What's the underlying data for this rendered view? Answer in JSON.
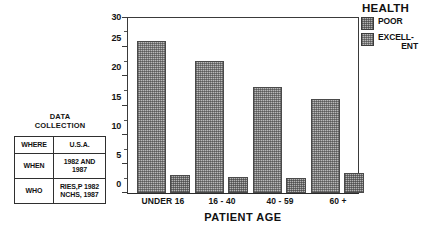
{
  "chart_data": {
    "type": "bar",
    "title": "",
    "xlabel": "PATIENT AGE",
    "ylabel": "",
    "categories": [
      "UNDER 16",
      "16 - 40",
      "40 - 59",
      "60 +"
    ],
    "ylim": [
      0,
      30
    ],
    "ytick_labels": [
      "0",
      "5",
      "10",
      "15",
      "20",
      "25",
      "30"
    ],
    "ytick_values": [
      0,
      5,
      10,
      15,
      20,
      25,
      30
    ],
    "minor_tick_step": 2.5,
    "grid": false,
    "legend_position": "top-right",
    "legend_title": "HEALTH",
    "series": [
      {
        "name": "EXCELLENT",
        "legend_label_line1": "EXCELL-",
        "legend_label_line2": "ENT",
        "values": [
          26,
          22.5,
          18,
          16
        ],
        "fill": "dither-excellent"
      },
      {
        "name": "POOR",
        "legend_label_line1": "POOR",
        "legend_label_line2": "",
        "values": [
          3,
          2.8,
          2.6,
          3.4
        ],
        "fill": "dither-poor"
      }
    ]
  },
  "legend": {
    "title": "HEALTH",
    "entries": [
      {
        "label": "POOR",
        "label2": ""
      },
      {
        "label": "EXCELL-",
        "label2": "ENT"
      }
    ]
  },
  "axis": {
    "x_title": "PATIENT AGE",
    "x_labels": [
      "UNDER 16",
      "16 - 40",
      "40 - 59",
      "60 +"
    ],
    "y_labels": [
      "30",
      "25",
      "20",
      "15",
      "10",
      "5",
      "0"
    ]
  },
  "data_collection": {
    "title_line1": "DATA",
    "title_line2": "COLLECTION",
    "rows": [
      {
        "key": "WHERE",
        "value_line1": "U.S.A.",
        "value_line2": ""
      },
      {
        "key": "WHEN",
        "value_line1": "1982 AND",
        "value_line2": "1987"
      },
      {
        "key": "WHO",
        "value_line1": "RIES,P  1982",
        "value_line2": "NCHS, 1987"
      }
    ]
  },
  "colors": {
    "axis": "#3a3a3a",
    "text": "#121212",
    "bar_fill": "#b9b9b9",
    "bar_border": "#4a4a4a",
    "background": "#ffffff"
  }
}
